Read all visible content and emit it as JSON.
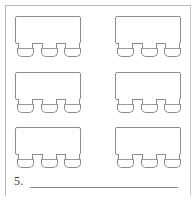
{
  "page": {
    "background_color": "#ffffff",
    "frame_color": "#b9b9b9",
    "line_color": "#8c8c8c"
  },
  "worksheet": {
    "figure_label": "table-with-three-chairs",
    "rows": 3,
    "columns": 2,
    "total_figures": 6,
    "chairs_per_figure": 3,
    "figures": [
      {
        "id": "figure-1",
        "row": 0,
        "column": 0,
        "chairs": 3
      },
      {
        "id": "figure-2",
        "row": 0,
        "column": 1,
        "chairs": 3
      },
      {
        "id": "figure-3",
        "row": 1,
        "column": 0,
        "chairs": 3
      },
      {
        "id": "figure-4",
        "row": 1,
        "column": 1,
        "chairs": 3
      },
      {
        "id": "figure-5",
        "row": 2,
        "column": 0,
        "chairs": 3
      },
      {
        "id": "figure-6",
        "row": 2,
        "column": 1,
        "chairs": 3
      }
    ]
  },
  "question": {
    "number": "5.",
    "answer_value": "",
    "answer_placeholder": ""
  }
}
